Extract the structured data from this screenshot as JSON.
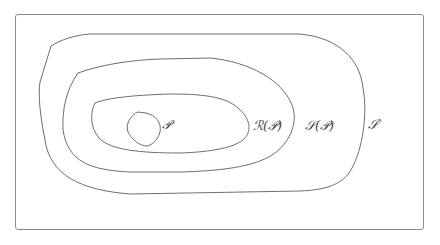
{
  "diagram": {
    "type": "nested-regions",
    "labels": {
      "p": "𝒫",
      "r": "ℛ(𝒫)",
      "s": "𝒮(𝒫)",
      "star": "𝒮",
      "star_sup": "*"
    },
    "regions": [
      {
        "name": "P",
        "label": "𝒫"
      },
      {
        "name": "R(P)",
        "label": "ℛ(𝒫)"
      },
      {
        "name": "S(P)",
        "label": "𝒮(𝒫)"
      },
      {
        "name": "S*",
        "label": "𝒮*"
      }
    ],
    "stroke_color": "#6e6e6e"
  }
}
